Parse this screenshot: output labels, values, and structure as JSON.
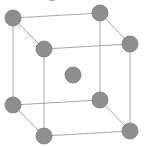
{
  "diagram": {
    "type": "body-centered-cubic-unit-cell",
    "colors": {
      "atom": "#8e8e8e",
      "atom_outline": "#7a7a7a",
      "edge": "#a6a6a6",
      "background": "#ffffff"
    },
    "atom_radius": 8,
    "atoms": [
      {
        "id": "back-top-left",
        "x": 13,
        "y": 18
      },
      {
        "id": "back-top-right",
        "x": 100,
        "y": 13
      },
      {
        "id": "front-top-left",
        "x": 44,
        "y": 49
      },
      {
        "id": "front-top-right",
        "x": 130,
        "y": 44
      },
      {
        "id": "back-bottom-left",
        "x": 13,
        "y": 105
      },
      {
        "id": "back-bottom-right",
        "x": 100,
        "y": 100
      },
      {
        "id": "front-bottom-left",
        "x": 44,
        "y": 136
      },
      {
        "id": "front-bottom-right",
        "x": 130,
        "y": 131
      },
      {
        "id": "body-center",
        "x": 73,
        "y": 75
      }
    ]
  }
}
